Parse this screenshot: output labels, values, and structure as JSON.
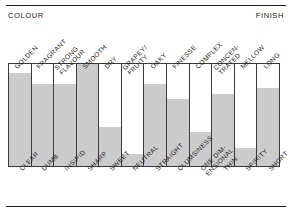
{
  "header": {
    "left_caption": "COLOUR",
    "right_caption": "FINISH"
  },
  "chart_data": {
    "type": "bar",
    "title": "",
    "subtitle": "",
    "xlabel": "",
    "ylabel": "",
    "ylim": [
      0,
      100
    ],
    "grid": false,
    "legend": "none",
    "axis_captions": {
      "left": "COLOUR",
      "right": "FINISH"
    },
    "top_labels": [
      "GOLDEN",
      "FRAGRANT",
      "STRONG\nFLAVOUR",
      "SMOOTH",
      "DRY",
      "GRAPEY/\nFRUITY",
      "OAKY",
      "FINESSE",
      "COMPLEX",
      "CONCEN-\nTRATED",
      "MELLOW",
      "LONG"
    ],
    "bottom_labels": [
      "CLEAR",
      "DUMB",
      "INSIPID",
      "SHARP",
      "SWEET",
      "NEUTRAL",
      "STRAIGHT",
      "CLUMSINESS",
      "ONE DIM-\nENSIONAL",
      "THIN",
      "SPIRITY",
      "SHORT"
    ],
    "categories": [
      "GOLDEN / CLEAR",
      "FRAGRANT / DUMB",
      "STRONG FLAVOUR / INSIPID",
      "SMOOTH / SHARP",
      "DRY / SWEET",
      "GRAPEY-FRUITY / NEUTRAL",
      "OAKY / STRAIGHT",
      "FINESSE / CLUMSINESS",
      "COMPLEX / ONE DIMENSIONAL",
      "CONCENTRATED / THIN",
      "MELLOW / SPIRITY",
      "LONG / SHORT"
    ],
    "values": [
      91,
      80,
      80,
      100,
      38,
      12,
      80,
      66,
      33,
      71,
      18,
      76
    ],
    "bar_color": "#cccccc",
    "frame_color": "#3a3a3a"
  }
}
